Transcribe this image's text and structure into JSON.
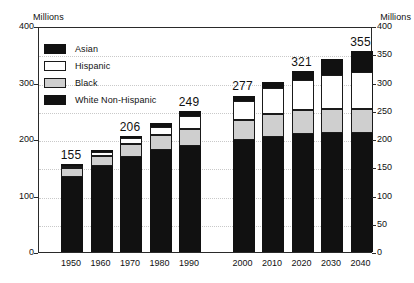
{
  "chart_data": {
    "type": "bar",
    "subtype": "stacked-bar",
    "title": "",
    "subtitle": "",
    "xlabel": "",
    "ylabel": "Millions",
    "y2label": "Millions",
    "ylim": [
      0,
      400
    ],
    "grid": true,
    "legend_position": "inside-top-left",
    "categories": [
      "1950",
      "1960",
      "1970",
      "1980",
      "1990",
      "2000",
      "2010",
      "2020",
      "2030",
      "2040"
    ],
    "series": [
      {
        "name": "White Non-Hispanic",
        "color": "#111111",
        "values": [
          137,
          152,
          168,
          180,
          188,
          198,
          204,
          208,
          210,
          211
        ]
      },
      {
        "name": "Black",
        "color": "#cfcfcf",
        "values": [
          15,
          19,
          23,
          27,
          30,
          35,
          40,
          44,
          44,
          43
        ]
      },
      {
        "name": "Hispanic",
        "color": "#ffffff",
        "values": [
          3,
          7,
          11,
          15,
          22,
          35,
          46,
          52,
          60,
          65
        ]
      },
      {
        "name": "Asian",
        "color": "#111111",
        "values": [
          1,
          2,
          4,
          6,
          9,
          9,
          11,
          17,
          27,
          36
        ]
      }
    ],
    "totals": [
      155,
      181,
      206,
      228,
      249,
      277,
      301,
      321,
      341,
      355
    ],
    "total_labels_shown": [
      "155",
      "",
      "206",
      "",
      "249",
      "277",
      "",
      "321",
      "",
      "355"
    ],
    "y_ticks_left": [
      "0",
      "100",
      "200",
      "300",
      "400"
    ],
    "y_tick_values_left": [
      0,
      100,
      200,
      300,
      400
    ],
    "y_ticks_right": [
      "0",
      "50",
      "100",
      "150",
      "200",
      "250",
      "300",
      "350",
      "400"
    ],
    "y_tick_values_right": [
      0,
      50,
      100,
      150,
      200,
      250,
      300,
      350,
      400
    ],
    "gridline_values": [
      50,
      100,
      150,
      200,
      250,
      300,
      350
    ],
    "group_gap_after_category": "1990"
  },
  "axis": {
    "left_caption": "Millions",
    "right_caption": "Millions"
  },
  "legend": {
    "items": [
      {
        "label": "Asian",
        "swatch": "swatch-asian"
      },
      {
        "label": "Hispanic",
        "swatch": "swatch-hispanic"
      },
      {
        "label": "Black",
        "swatch": "swatch-black"
      },
      {
        "label": "White Non-Hispanic",
        "swatch": "swatch-white-non-hispanic"
      }
    ]
  }
}
